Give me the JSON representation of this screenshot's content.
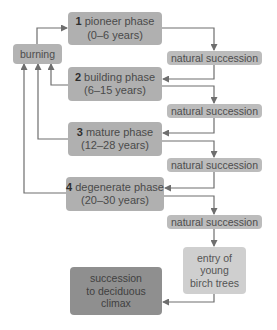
{
  "phases": [
    {
      "number": "1",
      "name": "pioneer phase",
      "range": "(0–6 years)"
    },
    {
      "number": "2",
      "name": "building phase",
      "range": "(6–15 years)"
    },
    {
      "number": "3",
      "name": "mature phase",
      "range": "(12–28 years)"
    },
    {
      "number": "4",
      "name": "degenerate phase",
      "range": "(20–30 years)"
    }
  ],
  "burning": {
    "label": "burning"
  },
  "natural_succession": [
    {
      "label": "natural succession"
    },
    {
      "label": "natural succession"
    },
    {
      "label": "natural succession"
    },
    {
      "label": "natural succession"
    }
  ],
  "birch": {
    "line1": "entry of",
    "line2": "young",
    "line3": "birch trees"
  },
  "climax": {
    "line1": "succession",
    "line2": "to deciduous",
    "line3": "climax"
  },
  "colors": {
    "phase_box": "#b0b0b0",
    "natural_succession_box": "#bcbcbc",
    "birch_box": "#cfcfcf",
    "climax_box": "#8f8f8f",
    "connector": "#6e6e6e"
  }
}
